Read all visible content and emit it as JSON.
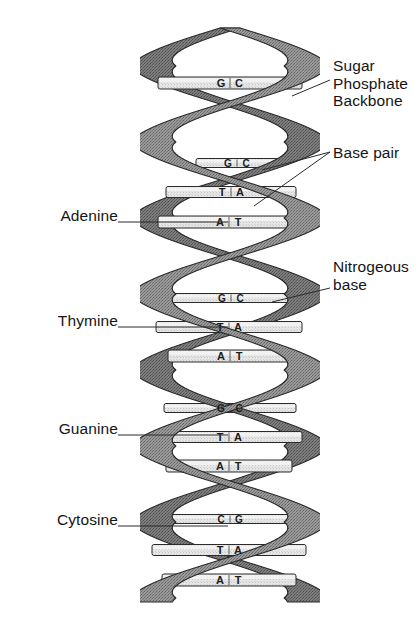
{
  "figure": {
    "background_color": "#ffffff",
    "ribbon_color": "#8d8d8d",
    "ribbon_shadow_color": "#6e6e6e",
    "rung_color": "#e3e3e3",
    "outline_color": "#2b2b2b",
    "leader_color": "#2b2b2b",
    "text_color": "#151515"
  },
  "labels_left": [
    {
      "id": "adenine",
      "text": "Adenine",
      "x": 22,
      "y": 207,
      "leader_to_x": 228,
      "leader_to_y": 222
    },
    {
      "id": "thymine",
      "text": "Thymine",
      "x": 22,
      "y": 312,
      "leader_to_x": 228,
      "leader_to_y": 327
    },
    {
      "id": "guanine",
      "text": "Guanine",
      "x": 22,
      "y": 420,
      "leader_to_x": 228,
      "leader_to_y": 435
    },
    {
      "id": "cytosine",
      "text": "Cytosine",
      "x": 22,
      "y": 511,
      "leader_to_x": 228,
      "leader_to_y": 526
    }
  ],
  "labels_right": [
    {
      "id": "sugar-phosphate-backbone",
      "text": "Sugar\nPhosphate\nBackbone",
      "lines": [
        "Sugar",
        "Phosphate",
        "Backbone"
      ],
      "x": 333,
      "y": 57,
      "leader_from_x": 330,
      "leader_from_y": 80,
      "leader_to_x": 292,
      "leader_to_y": 96
    },
    {
      "id": "base-pair",
      "text": "Base pair",
      "lines": [
        "Base pair"
      ],
      "x": 333,
      "y": 144,
      "leader_from_x": 330,
      "leader_from_y": 152,
      "leader_to_x": 262,
      "leader_to_y": 170
    },
    {
      "id": "nitrogeous-base",
      "text": "Nitrogeous\nbase",
      "lines": [
        "Nitrogeous",
        "base"
      ],
      "x": 333,
      "y": 258,
      "leader_from_x": 330,
      "leader_from_y": 288,
      "leader_to_x": 272,
      "leader_to_y": 302
    }
  ],
  "base_pairs": [
    {
      "id": "bp-1",
      "left": "G",
      "right": "C",
      "y": 83,
      "x1": 158,
      "x2": 302,
      "turn": 1,
      "depth": "front"
    },
    {
      "id": "bp-2",
      "left": "G",
      "right": "C",
      "y": 163,
      "x1": 196,
      "x2": 278,
      "turn": 2,
      "depth": "back"
    },
    {
      "id": "bp-3",
      "left": "T",
      "right": "A",
      "y": 192,
      "x1": 166,
      "x2": 296,
      "turn": 2,
      "depth": "mid"
    },
    {
      "id": "bp-4",
      "left": "A",
      "right": "T",
      "y": 222,
      "x1": 158,
      "x2": 300,
      "turn": 2,
      "depth": "front"
    },
    {
      "id": "bp-5",
      "left": "G",
      "right": "C",
      "y": 298,
      "x1": 166,
      "x2": 296,
      "turn": 3,
      "depth": "back"
    },
    {
      "id": "bp-6",
      "left": "T",
      "right": "A",
      "y": 327,
      "x1": 156,
      "x2": 302,
      "turn": 3,
      "depth": "mid"
    },
    {
      "id": "bp-7",
      "left": "A",
      "right": "T",
      "y": 356,
      "x1": 168,
      "x2": 292,
      "turn": 3,
      "depth": "front"
    },
    {
      "id": "bp-8",
      "left": "G",
      "right": "C",
      "y": 408,
      "x1": 164,
      "x2": 296,
      "turn": 4,
      "depth": "back"
    },
    {
      "id": "bp-9",
      "left": "T",
      "right": "A",
      "y": 437,
      "x1": 156,
      "x2": 302,
      "turn": 4,
      "depth": "mid"
    },
    {
      "id": "bp-10",
      "left": "A",
      "right": "T",
      "y": 466,
      "x1": 166,
      "x2": 292,
      "turn": 4,
      "depth": "front"
    },
    {
      "id": "bp-11",
      "left": "C",
      "right": "G",
      "y": 519,
      "x1": 160,
      "x2": 300,
      "turn": 5,
      "depth": "back"
    },
    {
      "id": "bp-12",
      "left": "T",
      "right": "A",
      "y": 550,
      "x1": 152,
      "x2": 306,
      "turn": 5,
      "depth": "mid"
    },
    {
      "id": "bp-13",
      "left": "A",
      "right": "T",
      "y": 580,
      "x1": 162,
      "x2": 296,
      "turn": 5,
      "depth": "front"
    }
  ],
  "helix": {
    "center_x": 230,
    "amplitude": 78,
    "top_y": 28,
    "bottom_y": 602,
    "period": 152,
    "ribbon_width": 20
  }
}
